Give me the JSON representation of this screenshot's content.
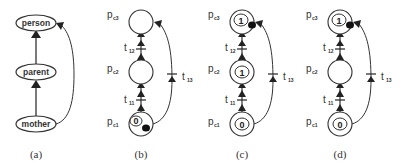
{
  "figure": {
    "panels": [
      {
        "caption": "(a)",
        "type": "taxonomy",
        "nodes": [
          {
            "label": "person"
          },
          {
            "label": "parent"
          },
          {
            "label": "mother"
          }
        ],
        "edges": [
          {
            "from": "mother",
            "to": "parent"
          },
          {
            "from": "parent",
            "to": "person"
          },
          {
            "from": "mother",
            "to": "person"
          }
        ]
      },
      {
        "caption": "(b)",
        "type": "petri-net",
        "places": [
          {
            "label": "p",
            "sub": "c3",
            "token": ""
          },
          {
            "label": "p",
            "sub": "c2",
            "token": ""
          },
          {
            "label": "p",
            "sub": "c1",
            "token": "0",
            "dot": true
          }
        ],
        "transitions": [
          {
            "label": "t",
            "sub": "12"
          },
          {
            "label": "t",
            "sub": "11"
          },
          {
            "label": "t",
            "sub": "13"
          }
        ]
      },
      {
        "caption": "(c)",
        "type": "petri-net",
        "places": [
          {
            "label": "p",
            "sub": "c3",
            "token": "1",
            "dot": true
          },
          {
            "label": "p",
            "sub": "c2",
            "token": "1"
          },
          {
            "label": "p",
            "sub": "c1",
            "token": "0"
          }
        ],
        "transitions": [
          {
            "label": "t",
            "sub": "12"
          },
          {
            "label": "t",
            "sub": "11"
          },
          {
            "label": "t",
            "sub": "13"
          }
        ]
      },
      {
        "caption": "(d)",
        "type": "petri-net",
        "places": [
          {
            "label": "p",
            "sub": "c3",
            "token": "1",
            "dot": true
          },
          {
            "label": "p",
            "sub": "c2",
            "token": ""
          },
          {
            "label": "p",
            "sub": "c1",
            "token": "0"
          }
        ],
        "transitions": [
          {
            "label": "t",
            "sub": "12"
          },
          {
            "label": "t",
            "sub": "11"
          },
          {
            "label": "t",
            "sub": "13"
          }
        ]
      }
    ]
  }
}
